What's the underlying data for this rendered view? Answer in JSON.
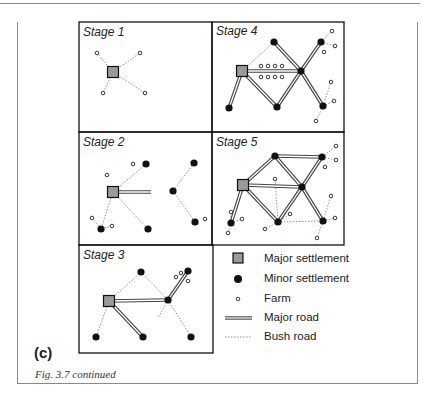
{
  "figure": {
    "part_label": "(c)",
    "caption": "Fig. 3.7  continued"
  },
  "colors": {
    "major_settlement_fill": "#9a9a9a",
    "stroke": "#111111",
    "bush_road": "#777777",
    "major_road_fill": "#ffffff"
  },
  "legend": [
    {
      "symbol": "major-settlement",
      "label": "Major settlement"
    },
    {
      "symbol": "minor-settlement",
      "label": "Minor settlement"
    },
    {
      "symbol": "farm",
      "label": "Farm"
    },
    {
      "symbol": "major-road",
      "label": "Major road"
    },
    {
      "symbol": "bush-road",
      "label": "Bush road"
    }
  ],
  "panels": [
    {
      "id": "stage-1",
      "title": "Stage 1",
      "major": [
        [
          113,
          72
        ]
      ],
      "minor": [],
      "farms": [
        [
          97,
          53
        ],
        [
          140,
          53
        ],
        [
          103,
          93
        ],
        [
          145,
          93
        ]
      ],
      "major_roads": [],
      "bush_roads": [
        [
          [
            113,
            72
          ],
          [
            97,
            53
          ]
        ],
        [
          [
            113,
            72
          ],
          [
            140,
            53
          ]
        ],
        [
          [
            113,
            72
          ],
          [
            103,
            93
          ]
        ],
        [
          [
            113,
            72
          ],
          [
            145,
            93
          ]
        ]
      ]
    },
    {
      "id": "stage-2",
      "title": "Stage 2",
      "major": [
        [
          113,
          192
        ]
      ],
      "minor": [
        [
          146,
          164
        ],
        [
          101,
          229
        ],
        [
          148,
          229
        ],
        [
          194,
          163
        ],
        [
          173,
          191
        ],
        [
          195,
          222
        ]
      ],
      "farms": [
        [
          133,
          164
        ],
        [
          107,
          175
        ],
        [
          92,
          218
        ],
        [
          112,
          226
        ],
        [
          205,
          219
        ]
      ],
      "major_roads": [
        [
          [
            113,
            192
          ],
          [
            151,
            192
          ]
        ]
      ],
      "bush_roads": [
        [
          [
            113,
            192
          ],
          [
            146,
            164
          ]
        ],
        [
          [
            113,
            192
          ],
          [
            148,
            229
          ]
        ],
        [
          [
            113,
            192
          ],
          [
            101,
            229
          ]
        ],
        [
          [
            92,
            218
          ],
          [
            101,
            229
          ]
        ],
        [
          [
            112,
            226
          ],
          [
            101,
            229
          ]
        ],
        [
          [
            194,
            163
          ],
          [
            173,
            191
          ]
        ],
        [
          [
            173,
            191
          ],
          [
            195,
            222
          ]
        ]
      ]
    },
    {
      "id": "stage-3",
      "title": "Stage 3",
      "major": [
        [
          109,
          301
        ]
      ],
      "minor": [
        [
          141,
          272
        ],
        [
          96,
          337
        ],
        [
          143,
          337
        ],
        [
          168,
          300
        ],
        [
          188,
          271
        ],
        [
          191,
          337
        ]
      ],
      "farms": [
        [
          176,
          277
        ],
        [
          181,
          273
        ],
        [
          188,
          281
        ]
      ],
      "major_roads": [
        [
          [
            109,
            301
          ],
          [
            168,
            300
          ]
        ],
        [
          [
            109,
            301
          ],
          [
            143,
            337
          ]
        ],
        [
          [
            168,
            300
          ],
          [
            188,
            271
          ]
        ]
      ],
      "bush_roads": [
        [
          [
            109,
            301
          ],
          [
            141,
            272
          ]
        ],
        [
          [
            141,
            272
          ],
          [
            168,
            300
          ]
        ],
        [
          [
            109,
            301
          ],
          [
            96,
            337
          ]
        ],
        [
          [
            168,
            300
          ],
          [
            191,
            337
          ]
        ],
        [
          [
            168,
            300
          ],
          [
            158,
            318
          ]
        ]
      ]
    },
    {
      "id": "stage-4",
      "title": "Stage 4",
      "major": [
        [
          242,
          71
        ]
      ],
      "minor": [
        [
          274,
          42
        ],
        [
          229,
          108
        ],
        [
          277,
          107
        ],
        [
          301,
          71
        ],
        [
          321,
          42
        ],
        [
          323,
          106
        ]
      ],
      "farms": [
        [
          261,
          66
        ],
        [
          268,
          66
        ],
        [
          275,
          66
        ],
        [
          282,
          66
        ],
        [
          261,
          77
        ],
        [
          268,
          77
        ],
        [
          275,
          77
        ],
        [
          282,
          77
        ],
        [
          332,
          31
        ],
        [
          335,
          46
        ],
        [
          324,
          52
        ],
        [
          331,
          82
        ],
        [
          334,
          101
        ],
        [
          316,
          121
        ]
      ],
      "major_roads": [
        [
          [
            242,
            71
          ],
          [
            301,
            71
          ]
        ],
        [
          [
            242,
            71
          ],
          [
            229,
            108
          ]
        ],
        [
          [
            242,
            71
          ],
          [
            277,
            107
          ]
        ],
        [
          [
            277,
            107
          ],
          [
            301,
            71
          ]
        ],
        [
          [
            274,
            42
          ],
          [
            301,
            71
          ]
        ],
        [
          [
            301,
            71
          ],
          [
            321,
            42
          ]
        ],
        [
          [
            301,
            71
          ],
          [
            323,
            106
          ]
        ]
      ],
      "bush_roads": [
        [
          [
            242,
            71
          ],
          [
            274,
            42
          ]
        ],
        [
          [
            321,
            42
          ],
          [
            332,
            31
          ]
        ],
        [
          [
            321,
            42
          ],
          [
            335,
            46
          ]
        ],
        [
          [
            323,
            106
          ],
          [
            331,
            82
          ]
        ],
        [
          [
            323,
            106
          ],
          [
            334,
            101
          ]
        ],
        [
          [
            323,
            106
          ],
          [
            316,
            121
          ]
        ]
      ]
    },
    {
      "id": "stage-5",
      "title": "Stage 5",
      "major": [
        [
          243,
          185
        ]
      ],
      "minor": [
        [
          275,
          156
        ],
        [
          322,
          157
        ],
        [
          302,
          187
        ],
        [
          231,
          223
        ],
        [
          278,
          222
        ],
        [
          323,
          221
        ]
      ],
      "farms": [
        [
          336,
          146
        ],
        [
          336,
          160
        ],
        [
          325,
          167
        ],
        [
          275,
          179
        ],
        [
          231,
          212
        ],
        [
          242,
          219
        ],
        [
          228,
          233
        ],
        [
          290,
          214
        ],
        [
          265,
          229
        ],
        [
          331,
          196
        ],
        [
          335,
          218
        ],
        [
          317,
          238
        ]
      ],
      "major_roads": [
        [
          [
            243,
            185
          ],
          [
            302,
            187
          ]
        ],
        [
          [
            243,
            185
          ],
          [
            275,
            156
          ]
        ],
        [
          [
            275,
            156
          ],
          [
            322,
            157
          ]
        ],
        [
          [
            275,
            156
          ],
          [
            302,
            187
          ]
        ],
        [
          [
            322,
            157
          ],
          [
            302,
            187
          ]
        ],
        [
          [
            243,
            185
          ],
          [
            231,
            223
          ]
        ],
        [
          [
            243,
            185
          ],
          [
            278,
            222
          ]
        ],
        [
          [
            278,
            222
          ],
          [
            302,
            187
          ]
        ],
        [
          [
            302,
            187
          ],
          [
            323,
            221
          ]
        ]
      ],
      "bush_roads": [
        [
          [
            278,
            222
          ],
          [
            323,
            221
          ]
        ],
        [
          [
            275,
            179
          ],
          [
            278,
            222
          ]
        ],
        [
          [
            322,
            157
          ],
          [
            336,
            146
          ]
        ],
        [
          [
            322,
            157
          ],
          [
            336,
            160
          ]
        ],
        [
          [
            231,
            223
          ],
          [
            231,
            212
          ]
        ],
        [
          [
            231,
            223
          ],
          [
            242,
            219
          ]
        ],
        [
          [
            231,
            223
          ],
          [
            228,
            233
          ]
        ],
        [
          [
            278,
            222
          ],
          [
            290,
            214
          ]
        ],
        [
          [
            278,
            222
          ],
          [
            265,
            229
          ]
        ],
        [
          [
            323,
            221
          ],
          [
            331,
            196
          ]
        ],
        [
          [
            323,
            221
          ],
          [
            335,
            218
          ]
        ],
        [
          [
            323,
            221
          ],
          [
            317,
            238
          ]
        ]
      ]
    }
  ]
}
